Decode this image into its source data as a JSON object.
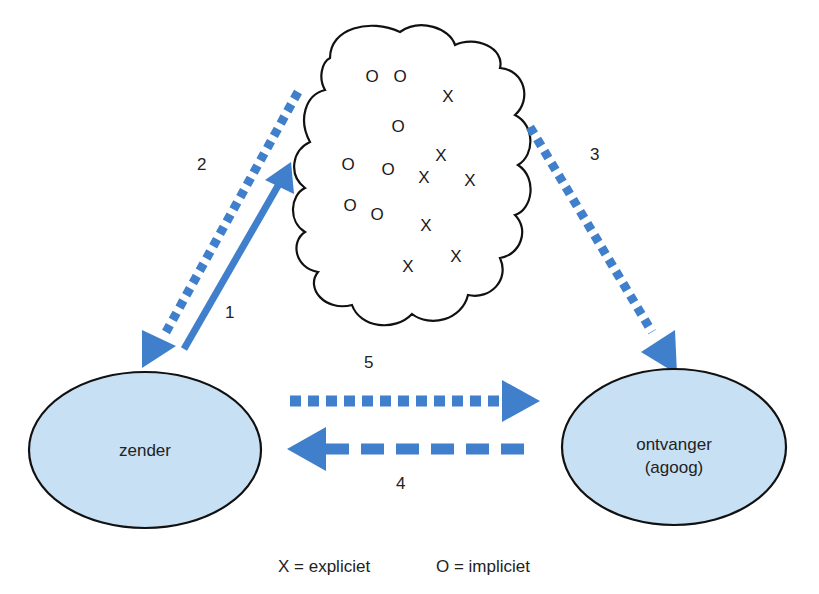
{
  "colors": {
    "arrow": "#3f7fcb",
    "ellipse_fill": "#c7e0f4",
    "outline": "#111111",
    "text": "#222222"
  },
  "nodes": {
    "sender": {
      "label": "zender"
    },
    "receiver": {
      "label_line1": "ontvanger",
      "label_line2": "(agoog)"
    }
  },
  "cloud": {
    "marks": [
      {
        "symbol": "O",
        "x": 372,
        "y": 82
      },
      {
        "symbol": "O",
        "x": 400,
        "y": 82
      },
      {
        "symbol": "X",
        "x": 448,
        "y": 102
      },
      {
        "symbol": "O",
        "x": 398,
        "y": 132
      },
      {
        "symbol": "X",
        "x": 441,
        "y": 161
      },
      {
        "symbol": "O",
        "x": 348,
        "y": 170
      },
      {
        "symbol": "O",
        "x": 388,
        "y": 175
      },
      {
        "symbol": "X",
        "x": 424,
        "y": 183
      },
      {
        "symbol": "X",
        "x": 470,
        "y": 186
      },
      {
        "symbol": "O",
        "x": 350,
        "y": 211
      },
      {
        "symbol": "O",
        "x": 377,
        "y": 220
      },
      {
        "symbol": "X",
        "x": 426,
        "y": 231
      },
      {
        "symbol": "X",
        "x": 456,
        "y": 262
      },
      {
        "symbol": "X",
        "x": 408,
        "y": 272
      }
    ]
  },
  "arrows": {
    "a1": {
      "label": "1",
      "style": "solid",
      "direction": "zender → cloud"
    },
    "a2": {
      "label": "2",
      "style": "dotted",
      "direction": "cloud → zender"
    },
    "a3": {
      "label": "3",
      "style": "dotted",
      "direction": "cloud → ontvanger"
    },
    "a4": {
      "label": "4",
      "style": "dashed",
      "direction": "ontvanger → zender"
    },
    "a5": {
      "label": "5",
      "style": "dotted",
      "direction": "zender → ontvanger"
    }
  },
  "legend": {
    "explicit": "X = expliciet",
    "implicit": "O = impliciet"
  }
}
